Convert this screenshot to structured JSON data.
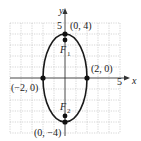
{
  "diagram": {
    "type": "ellipse-graph",
    "axes": {
      "x_label": "x",
      "y_label": "y",
      "x_tick_label": "5",
      "y_tick_label": "5",
      "range": [
        -5,
        5
      ]
    },
    "ellipse": {
      "center": [
        0,
        0
      ],
      "semi_major": 4,
      "semi_minor": 2,
      "orientation": "vertical"
    },
    "points": [
      {
        "id": "top-vertex",
        "label": "(0, 4)",
        "x": 0,
        "y": 4
      },
      {
        "id": "bottom-vertex",
        "label": "(0, −4)",
        "x": 0,
        "y": -4
      },
      {
        "id": "right-covertex",
        "label": "(2, 0)",
        "x": 2,
        "y": 0
      },
      {
        "id": "left-covertex",
        "label": "(−2, 0)",
        "x": -2,
        "y": 0
      }
    ],
    "foci": [
      {
        "id": "F1",
        "label": "F",
        "subscript": "1",
        "x": 0,
        "y": 3.46
      },
      {
        "id": "F2",
        "label": "F",
        "subscript": "2",
        "x": 0,
        "y": -3.46
      }
    ],
    "colors": {
      "grid": "#bbbbbb",
      "curve": "#1a1a1a",
      "axis": "#333333",
      "point": "#111111"
    }
  }
}
